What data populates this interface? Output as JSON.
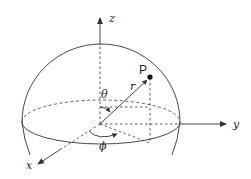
{
  "diagram": {
    "labels": {
      "z": "z",
      "y": "y",
      "x": "x",
      "point": "P",
      "radius": "r",
      "theta": "θ",
      "phi": "ϕ"
    },
    "colors": {
      "line": "#333333",
      "background": "#ffffff"
    }
  }
}
